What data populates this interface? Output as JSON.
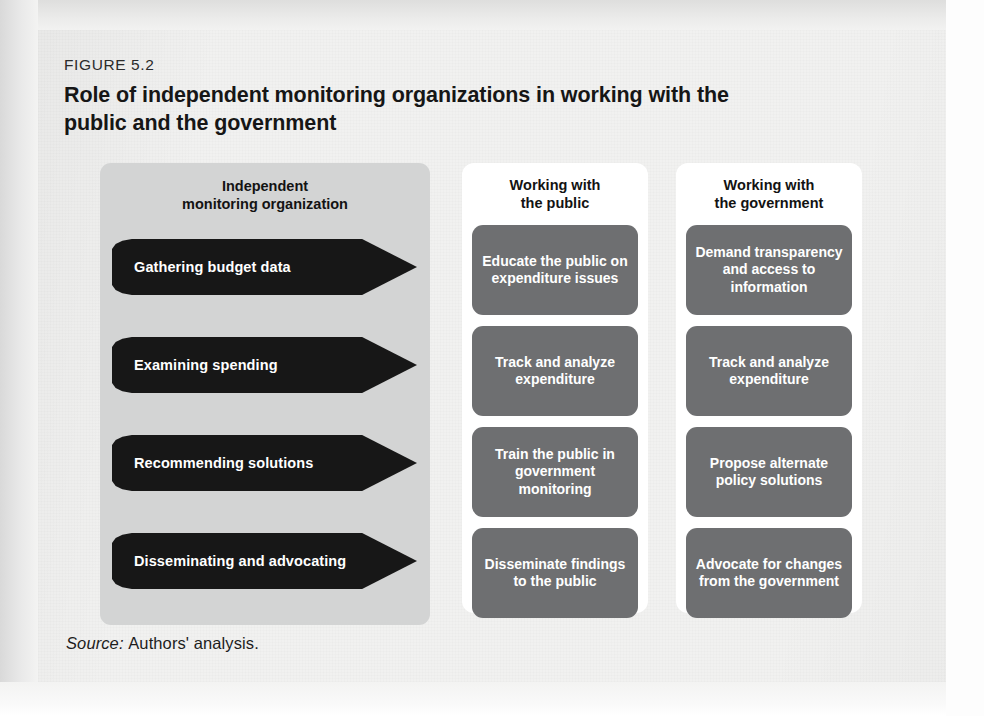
{
  "figure": {
    "number": "FIGURE 5.2",
    "title": "Role of independent monitoring organizations in working with the public and the government"
  },
  "left_panel": {
    "header": "Independent\nmonitoring organization",
    "header_line1": "Independent",
    "header_line2": "monitoring organization",
    "arrows": [
      {
        "label": "Gathering budget data"
      },
      {
        "label": "Examining spending"
      },
      {
        "label": "Recommending solutions"
      },
      {
        "label": "Disseminating and advocating"
      }
    ]
  },
  "columns": [
    {
      "id": "working-with-the-public",
      "header_line1": "Working with",
      "header_line2": "the public",
      "boxes": [
        {
          "text": "Educate the public on expenditure issues"
        },
        {
          "text": "Track and analyze expenditure"
        },
        {
          "text": "Train the public in government monitoring"
        },
        {
          "text": "Disseminate findings to the public"
        }
      ]
    },
    {
      "id": "working-with-the-government",
      "header_line1": "Working with",
      "header_line2": "the government",
      "boxes": [
        {
          "text": "Demand transparency and access to information"
        },
        {
          "text": "Track and analyze expenditure"
        },
        {
          "text": "Propose alternate policy solutions"
        },
        {
          "text": "Advocate for changes from the government"
        }
      ]
    }
  ],
  "source": {
    "label": "Source:",
    "text": "Authors' analysis."
  },
  "colors": {
    "page": "#f1f1f0",
    "panel_gray": "#d3d4d4",
    "box_gray": "#6e6f71",
    "arrow_black": "#171717",
    "column_white": "#ffffff",
    "text_dark": "#131313",
    "text_light": "#ffffff"
  }
}
